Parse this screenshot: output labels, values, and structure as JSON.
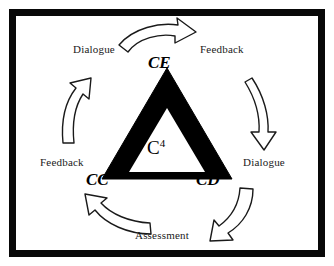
{
  "diagram": {
    "center_label": {
      "base": "C",
      "superscript": "4"
    },
    "frame_color": "#080808",
    "background_color": "#ffffff",
    "triangle": {
      "name": "c4-triangle",
      "fill": "#000000",
      "inner_fill": "#ffffff"
    },
    "nodes": [
      {
        "id": "ce",
        "label": "CE",
        "position": "apex-top"
      },
      {
        "id": "cc",
        "label": "CC",
        "position": "bottom-left"
      },
      {
        "id": "cd",
        "label": "CD",
        "position": "bottom-right"
      }
    ],
    "edge_labels": [
      {
        "id": "dialogue-top",
        "label": "Dialogue",
        "position": "top-left"
      },
      {
        "id": "feedback-top",
        "label": "Feedback",
        "position": "top-right"
      },
      {
        "id": "dialogue-right",
        "label": "Dialogue",
        "position": "middle-right"
      },
      {
        "id": "feedback-left",
        "label": "Feedback",
        "position": "middle-left"
      },
      {
        "id": "assessment",
        "label": "Assessment",
        "position": "bottom-center"
      }
    ],
    "arrows": [
      {
        "id": "arrow-top",
        "direction": "rightward-curve",
        "stroke": "#1a1a1a",
        "fill": "#ffffff"
      },
      {
        "id": "arrow-right",
        "direction": "downward-curve",
        "stroke": "#1a1a1a",
        "fill": "#ffffff"
      },
      {
        "id": "arrow-bottom-right",
        "direction": "down-left-curve",
        "stroke": "#1a1a1a",
        "fill": "#ffffff"
      },
      {
        "id": "arrow-bottom-left",
        "direction": "up-left-curve",
        "stroke": "#1a1a1a",
        "fill": "#ffffff"
      },
      {
        "id": "arrow-left",
        "direction": "upward-curve",
        "stroke": "#1a1a1a",
        "fill": "#ffffff"
      }
    ]
  }
}
